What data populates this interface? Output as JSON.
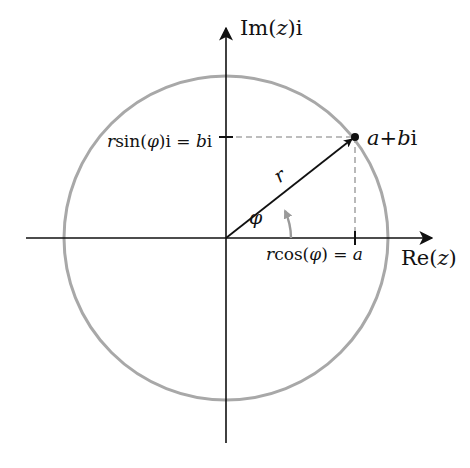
{
  "diagram": {
    "axes": {
      "imaginary_label": {
        "prefix": "Im(",
        "var": "z",
        "suffix": ")i"
      },
      "real_label": {
        "prefix": "Re(",
        "var": "z",
        "suffix": ")"
      }
    },
    "point": {
      "a": "a",
      "plus": "+",
      "b": "b",
      "i": "i"
    },
    "labels": {
      "radius": "r",
      "angle": "φ",
      "imag_projection": {
        "r": "r",
        "fn": "sin(",
        "phi": "φ",
        "close": ")i = ",
        "b": "b",
        "i": "i"
      },
      "real_projection": {
        "r": "r",
        "fn": "cos(",
        "phi": "φ",
        "close": ") = ",
        "a": "a"
      }
    },
    "colors": {
      "axis": "#111111",
      "circle": "#a8a8a8",
      "dashed": "#a8a8a8",
      "angle_arc": "#9a9a9a",
      "vector": "#111111",
      "background": "#ffffff"
    },
    "geometry": {
      "origin": [
        226,
        238
      ],
      "circle_radius": 162,
      "point": [
        355,
        137
      ],
      "angle_arc_radius": 65
    }
  }
}
